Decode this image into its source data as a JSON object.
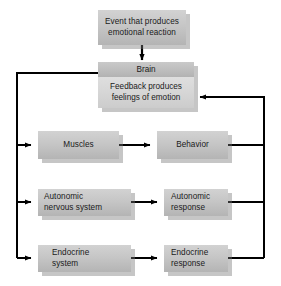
{
  "diagram": {
    "colors": {
      "box_fill_light": "#d2d2d2",
      "box_fill_dark": "#b4b4b4",
      "box_shadow": "#787878",
      "line": "#000000",
      "background": "#ffffff",
      "text": "#1a1a1a"
    },
    "nodes": {
      "event": {
        "line1": "Event that produces",
        "line2": "emotional reaction"
      },
      "brain": {
        "header": "Brain",
        "line1": "Feedback produces",
        "line2": "feelings of emotion"
      },
      "muscles": {
        "line1": "Muscles"
      },
      "behavior": {
        "line1": "Behavior"
      },
      "autonomic_nervous_system": {
        "line1": "Autonomic",
        "line2": "nervous system"
      },
      "autonomic_response": {
        "line1": "Autonomic",
        "line2": "response"
      },
      "endocrine_system": {
        "line1": "Endocrine",
        "line2": "system"
      },
      "endocrine_response": {
        "line1": "Endocrine",
        "line2": "response"
      }
    },
    "connectors": [
      {
        "name": "event-to-brain",
        "kind": "arrow-down"
      },
      {
        "name": "brain-to-left-bus",
        "kind": "line"
      },
      {
        "name": "left-bus-to-muscles",
        "kind": "arrow-right"
      },
      {
        "name": "left-bus-to-autonomic-nervous-system",
        "kind": "arrow-right"
      },
      {
        "name": "left-bus-to-endocrine-system",
        "kind": "arrow-right"
      },
      {
        "name": "muscles-to-behavior",
        "kind": "arrow-right"
      },
      {
        "name": "autonomic-nervous-system-to-autonomic-response",
        "kind": "arrow-right"
      },
      {
        "name": "endocrine-system-to-endocrine-response",
        "kind": "arrow-right"
      },
      {
        "name": "behavior-to-right-bus",
        "kind": "line"
      },
      {
        "name": "autonomic-response-to-right-bus",
        "kind": "line"
      },
      {
        "name": "endocrine-response-to-right-bus",
        "kind": "line"
      },
      {
        "name": "right-bus-feedback-to-brain",
        "kind": "arrow-left"
      }
    ]
  }
}
